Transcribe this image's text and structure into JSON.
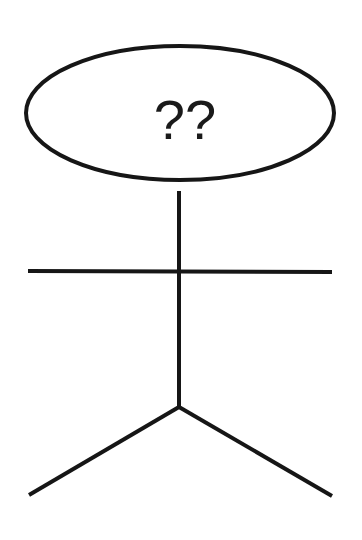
{
  "diagram": {
    "type": "stick-figure",
    "head": {
      "shape": "ellipse",
      "label": "??",
      "cx": 180,
      "cy": 113,
      "rx": 154,
      "ry": 67
    },
    "body": {
      "x1": 179,
      "y1": 191,
      "x2": 179,
      "y2": 407
    },
    "arms": {
      "x1": 28,
      "y1": 271,
      "x2": 332,
      "y2": 272
    },
    "left_leg": {
      "x1": 179,
      "y1": 407,
      "x2": 29,
      "y2": 495
    },
    "right_leg": {
      "x1": 179,
      "y1": 407,
      "x2": 332,
      "y2": 496
    },
    "colors": {
      "stroke": "#161616",
      "background": "#ffffff"
    }
  }
}
